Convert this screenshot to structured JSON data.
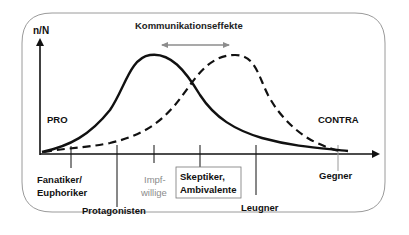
{
  "diagram": {
    "y_axis_label": "n/N",
    "top_label": "Kommunikationseffekte",
    "side_labels": {
      "left": "PRO",
      "right": "CONTRA"
    },
    "categories": [
      {
        "line1": "Fanatiker/",
        "line2": "Euphoriker",
        "style": "normal"
      },
      {
        "line1": "Protagonisten",
        "line2": "",
        "style": "normal"
      },
      {
        "line1": "Impf-",
        "line2": "willige",
        "style": "grey"
      },
      {
        "line1": "Skeptiker,",
        "line2": "Ambivalente",
        "style": "boxed"
      },
      {
        "line1": "Leugner",
        "line2": "",
        "style": "normal"
      },
      {
        "line1": "Gegner",
        "line2": "",
        "style": "normal"
      }
    ],
    "curves": [
      {
        "name": "initial distribution",
        "style": "solid"
      },
      {
        "name": "shifted distribution",
        "style": "dashed"
      }
    ],
    "colors": {
      "frame": "#9a9a9a",
      "line": "#111111",
      "arrow_grey": "#8c8c8c",
      "text_grey": "#8c8c8c"
    }
  }
}
